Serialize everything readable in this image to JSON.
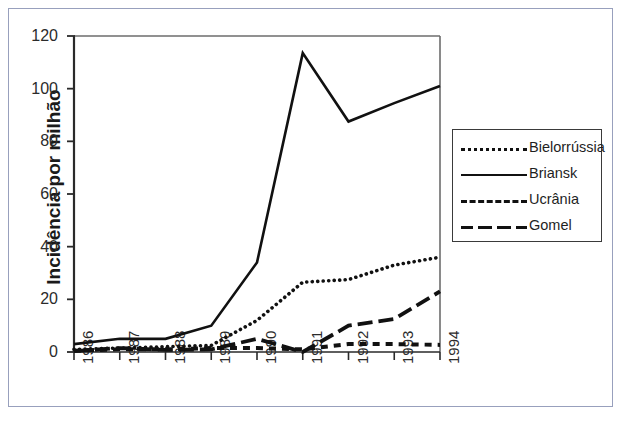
{
  "figure": {
    "border_color": "#98a0bd",
    "background": "#ffffff"
  },
  "axes": {
    "ylabel": "Incidência por milhão",
    "xlabel": "",
    "y_ticks": [
      "0",
      "20",
      "40",
      "60",
      "80",
      "100",
      "120"
    ],
    "x_ticks": [
      "1986",
      "1987",
      "1988",
      "1989",
      "1990",
      "1991",
      "1992",
      "1993",
      "1994"
    ]
  },
  "legend": {
    "position": "right",
    "entries": [
      {
        "label": "Bielorrússia",
        "style": "dotted"
      },
      {
        "label": "Briansk",
        "style": "solid"
      },
      {
        "label": "Ucrânia",
        "style": "short-dash"
      },
      {
        "label": "Gomel",
        "style": "long-dash"
      }
    ]
  },
  "chart_data": {
    "type": "line",
    "title": "",
    "xlabel": "",
    "ylabel": "Incidência por milhão",
    "x": [
      1986,
      1987,
      1988,
      1989,
      1990,
      1991,
      1992,
      1993,
      1994
    ],
    "categories": [
      "1986",
      "1987",
      "1988",
      "1989",
      "1990",
      "1991",
      "1992",
      "1993",
      "1994"
    ],
    "xlim": [
      1986,
      1994
    ],
    "ylim": [
      0,
      120
    ],
    "yticks": [
      0,
      20,
      40,
      60,
      80,
      100,
      120
    ],
    "grid": false,
    "legend_position": "right",
    "series": [
      {
        "name": "Bielorrússia",
        "style": "dotted",
        "color": "#111111",
        "values": [
          1,
          1.5,
          2,
          2.5,
          12,
          26.5,
          27.5,
          33,
          36
        ]
      },
      {
        "name": "Briansk",
        "style": "solid",
        "color": "#111111",
        "values": [
          3,
          5,
          5,
          10,
          34,
          113.5,
          87.5,
          94.5,
          101
        ]
      },
      {
        "name": "Ucrânia",
        "style": "short-dash",
        "color": "#111111",
        "values": [
          0.5,
          1,
          1,
          1.5,
          1.5,
          1,
          3,
          3,
          2.7
        ]
      },
      {
        "name": "Gomel",
        "style": "long-dash",
        "color": "#111111",
        "values": [
          0.3,
          1.5,
          0.8,
          1,
          5,
          0,
          10,
          12.5,
          23
        ]
      }
    ]
  }
}
